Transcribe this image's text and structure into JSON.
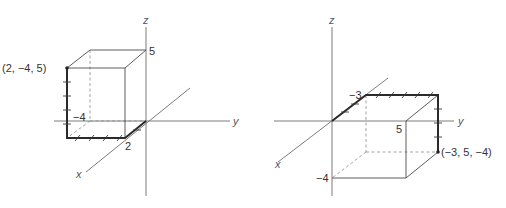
{
  "figures": [
    {
      "id": "left",
      "axes": {
        "x_label": "x",
        "y_label": "y",
        "z_label": "z"
      },
      "point": {
        "label": "(2, −4, 5)",
        "coords": [
          2,
          -4,
          5
        ]
      },
      "tick_labels": {
        "z": "5",
        "y": "−4",
        "x": "2"
      }
    },
    {
      "id": "right",
      "axes": {
        "x_label": "x",
        "y_label": "y",
        "z_label": "z"
      },
      "point": {
        "label": "(−3, 5, −4)",
        "coords": [
          -3,
          5,
          -4
        ]
      },
      "tick_labels": {
        "x": "−3",
        "y": "5",
        "z": "−4"
      }
    }
  ],
  "colors": {
    "axis": "#6e6e6e",
    "edge": "#4a4a4a",
    "bold_path": "#2a2a2a",
    "background": "#ffffff"
  }
}
